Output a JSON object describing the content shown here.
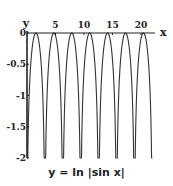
{
  "chart_data": {
    "type": "line",
    "title": "y = ln |sin x|",
    "xlabel": "x",
    "ylabel": "y",
    "xlim": [
      0,
      22
    ],
    "ylim": [
      -2,
      0
    ],
    "x_ticks": [
      5,
      10,
      15,
      20
    ],
    "x_tick_labels": [
      "5",
      "10",
      "15",
      "20"
    ],
    "y_ticks": [
      0,
      -0.5,
      -1,
      -1.5,
      -2
    ],
    "y_tick_labels": [
      "0",
      "-0.5",
      "-1",
      "-1.5",
      "-2"
    ],
    "grid": false,
    "legend": null,
    "series": [
      {
        "name": "y = ln |sin x|",
        "function": "ln|sin x|",
        "color": "#333333",
        "maxima": [
          {
            "x": 1.571,
            "y": 0
          },
          {
            "x": 4.712,
            "y": 0
          },
          {
            "x": 7.854,
            "y": 0
          },
          {
            "x": 10.996,
            "y": 0
          },
          {
            "x": 14.137,
            "y": 0
          },
          {
            "x": 17.279,
            "y": 0
          },
          {
            "x": 20.42,
            "y": 0
          }
        ],
        "vertical_asymptotes": [
          0,
          3.142,
          6.283,
          9.425,
          12.566,
          15.708,
          18.85,
          21.991
        ]
      }
    ]
  },
  "labels": {
    "y_axis": "y",
    "x_axis": "x",
    "caption": "y = ln |sin x|"
  }
}
